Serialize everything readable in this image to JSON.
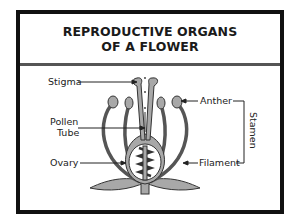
{
  "diagram": {
    "title_line1": "REPRODUCTIVE ORGANS",
    "title_line2": "OF A FLOWER",
    "labels": {
      "stigma": "Stigma",
      "pollen_tube_1": "Pollen",
      "pollen_tube_2": "Tube",
      "ovary": "Ovary",
      "anther": "Anther",
      "filament": "Filament",
      "stamen": "Stamen"
    },
    "colors": {
      "frame": "#111111",
      "organ_fill": "#a8a8a8",
      "outline": "#333333"
    }
  }
}
